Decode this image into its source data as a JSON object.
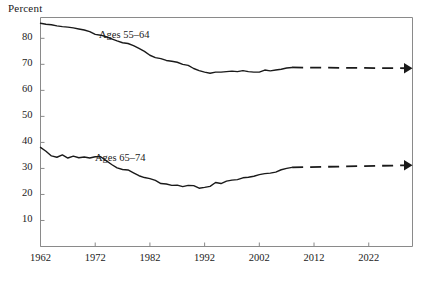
{
  "chart_data": {
    "type": "line",
    "title": "",
    "ylabel": "Percent",
    "xlabel": "",
    "ylim": [
      0,
      88
    ],
    "xlim": [
      1962,
      2030
    ],
    "grid": false,
    "legend": "inline-labels",
    "ytick_labels": [
      "10",
      "20",
      "30",
      "40",
      "50",
      "60",
      "70",
      "80"
    ],
    "ytick_values": [
      10,
      20,
      30,
      40,
      50,
      60,
      70,
      80
    ],
    "xtick_labels": [
      "1962",
      "1972",
      "1982",
      "1992",
      "2002",
      "2012",
      "2022"
    ],
    "xtick_values": [
      1962,
      1972,
      1982,
      1992,
      2002,
      2012,
      2022
    ],
    "projection_start_year": 2008,
    "projection_end_year": 2030,
    "marker": "triangle-arrowhead",
    "line_color": "#1a1a1a",
    "series": [
      {
        "name": "Ages 55–64",
        "label": "Ages 55–64",
        "label_x": 1975,
        "label_y": 77,
        "x": [
          1962,
          1963,
          1964,
          1965,
          1966,
          1967,
          1968,
          1969,
          1970,
          1971,
          1972,
          1973,
          1974,
          1975,
          1976,
          1977,
          1978,
          1979,
          1980,
          1981,
          1982,
          1983,
          1984,
          1985,
          1986,
          1987,
          1988,
          1989,
          1990,
          1991,
          1992,
          1993,
          1994,
          1995,
          1996,
          1997,
          1998,
          1999,
          2000,
          2001,
          2002,
          2003,
          2004,
          2005,
          2006,
          2007,
          2008
        ],
        "values": [
          85.8,
          85.4,
          85.2,
          84.8,
          84.5,
          84.3,
          84.0,
          83.6,
          83.2,
          82.6,
          81.5,
          81.2,
          80.6,
          79.8,
          79.0,
          78.3,
          78.0,
          77.2,
          76.1,
          75.0,
          73.5,
          72.6,
          72.2,
          71.5,
          71.2,
          70.8,
          70.0,
          69.6,
          68.4,
          67.6,
          67.0,
          66.6,
          67.0,
          67.0,
          67.2,
          67.4,
          67.2,
          67.6,
          67.2,
          67.0,
          67.0,
          67.8,
          67.5,
          67.8,
          68.1,
          68.6,
          68.8
        ],
        "projection_x": [
          2008,
          2030
        ],
        "projection_values": [
          68.8,
          68.5
        ],
        "endpoint_value": 68.5
      },
      {
        "name": "Ages 65–74",
        "label": "Ages 65–74",
        "label_x": 1974,
        "label_y": 34,
        "x": [
          1962,
          1963,
          1964,
          1965,
          1966,
          1967,
          1968,
          1969,
          1970,
          1971,
          1972,
          1973,
          1974,
          1975,
          1976,
          1977,
          1978,
          1979,
          1980,
          1981,
          1982,
          1983,
          1984,
          1985,
          1986,
          1987,
          1988,
          1989,
          1990,
          1991,
          1992,
          1993,
          1994,
          1995,
          1996,
          1997,
          1998,
          1999,
          2000,
          2001,
          2002,
          2003,
          2004,
          2005,
          2006,
          2007,
          2008
        ],
        "values": [
          38.1,
          36.6,
          34.8,
          34.3,
          35.2,
          34.0,
          34.7,
          34.1,
          34.4,
          34.0,
          34.5,
          34.5,
          33.0,
          31.5,
          30.2,
          29.6,
          29.4,
          28.3,
          27.2,
          26.5,
          26.1,
          25.4,
          24.2,
          24.0,
          23.5,
          23.6,
          23.0,
          23.5,
          23.4,
          22.4,
          22.7,
          23.1,
          24.6,
          24.2,
          25.1,
          25.5,
          25.7,
          26.4,
          26.6,
          27.0,
          27.6,
          28.0,
          28.2,
          28.6,
          29.5,
          30.0,
          30.4
        ],
        "projection_x": [
          2008,
          2030
        ],
        "projection_values": [
          30.4,
          31.2
        ],
        "endpoint_value": 31.2
      }
    ]
  }
}
